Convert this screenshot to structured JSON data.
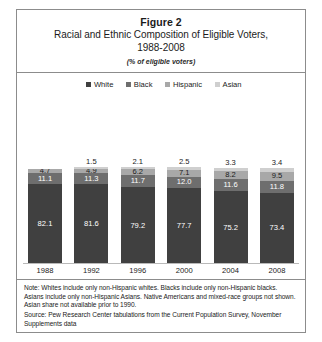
{
  "figure": {
    "number_label": "Figure 2",
    "title": "Racial and Ethnic Composition of Eligible Voters,",
    "title_line2": "1988-2008",
    "subtitle": "(% of eligible voters)"
  },
  "notes": {
    "note": "Note: Whites include only non-Hispanic whites.  Blacks include only non-Hispanic blacks. Asians include only non-Hispanic Asians. Native Americans and mixed-race groups not shown. Asian share not available prior to 1990.",
    "source": "Source: Pew Research Center tabulations from the Current Population Survey, November Supplements data"
  },
  "colors": {
    "white_series": "#404040",
    "black_series": "#6e6e6e",
    "hispanic_series": "#a8a8a8",
    "asian_series": "#cfcfcf",
    "frame_border": "#8c8c8c",
    "axis_line": "#b9b9b9",
    "background": "#ffffff"
  },
  "chart_data": {
    "type": "bar",
    "subtype": "stacked-column-100",
    "subtitle": "(% of eligible voters)",
    "xlabel": "",
    "ylabel": "% of eligible voters",
    "ylim": [
      0,
      100
    ],
    "grid": false,
    "legend_position": "top-center",
    "categories": [
      "1988",
      "1992",
      "1996",
      "2000",
      "2004",
      "2008"
    ],
    "series": [
      {
        "name": "White",
        "values": [
          82.1,
          81.6,
          79.2,
          77.7,
          75.2,
          73.4
        ]
      },
      {
        "name": "Black",
        "values": [
          11.1,
          11.3,
          11.7,
          12.0,
          11.6,
          11.8
        ]
      },
      {
        "name": "Hispanic",
        "values": [
          4.7,
          4.9,
          6.2,
          7.1,
          8.2,
          9.5
        ]
      },
      {
        "name": "Asian",
        "values": [
          null,
          1.5,
          2.1,
          2.5,
          3.3,
          3.4
        ]
      }
    ],
    "annotations": [
      "Asian share not available prior to 1990."
    ]
  },
  "legend": {
    "items": [
      {
        "label": "White"
      },
      {
        "label": "Black"
      },
      {
        "label": "Hispanic"
      },
      {
        "label": "Asian"
      }
    ]
  },
  "bars": [
    {
      "year": "1988",
      "asian": "",
      "hispanic": "4.7",
      "black": "11.1",
      "white": "82.1"
    },
    {
      "year": "1992",
      "asian": "1.5",
      "hispanic": "4.9",
      "black": "11.3",
      "white": "81.6"
    },
    {
      "year": "1996",
      "asian": "2.1",
      "hispanic": "6.2",
      "black": "11.7",
      "white": "79.2"
    },
    {
      "year": "2000",
      "asian": "2.5",
      "hispanic": "7.1",
      "black": "12.0",
      "white": "77.7"
    },
    {
      "year": "2004",
      "asian": "3.3",
      "hispanic": "8.2",
      "black": "11.6",
      "white": "75.2"
    },
    {
      "year": "2008",
      "asian": "3.4",
      "hispanic": "9.5",
      "black": "11.8",
      "white": "73.4"
    }
  ]
}
